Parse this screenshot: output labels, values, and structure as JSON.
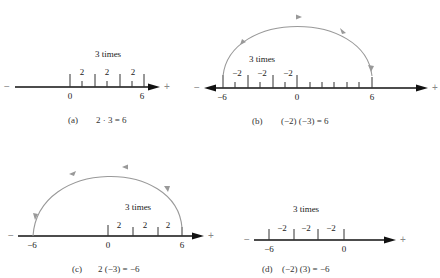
{
  "figure": {
    "panels": [
      {
        "id": "a",
        "caption_label": "(a)",
        "caption_equation": "2 · 3 = 6",
        "repeat_label": "3 times",
        "step_labels": [
          "2",
          "2",
          "2"
        ],
        "axis_labels": [
          "0",
          "6"
        ],
        "minus_sign": "−",
        "plus_sign": "+"
      },
      {
        "id": "b",
        "caption_label": "(b)",
        "caption_equation": "(−2) (−3) = 6",
        "repeat_label": "3 times",
        "step_labels": [
          "−2",
          "−2",
          "−2"
        ],
        "axis_labels": [
          "−6",
          "0",
          "6"
        ],
        "minus_sign": "−",
        "plus_sign": "+"
      },
      {
        "id": "c",
        "caption_label": "(c)",
        "caption_equation": "2 (−3) = −6",
        "repeat_label": "3 times",
        "step_labels": [
          "2",
          "2",
          "2"
        ],
        "axis_labels": [
          "−6",
          "0",
          "6"
        ],
        "minus_sign": "−",
        "plus_sign": "+"
      },
      {
        "id": "d",
        "caption_label": "(d)",
        "caption_equation": "(−2) (3) = −6",
        "repeat_label": "3 times",
        "step_labels": [
          "−2",
          "−2",
          "−2"
        ],
        "axis_labels": [
          "−6",
          "0"
        ],
        "minus_sign": "−",
        "plus_sign": "+"
      }
    ],
    "colors": {
      "axis": "#111111",
      "arc": "#999999",
      "text": "#222222"
    }
  }
}
